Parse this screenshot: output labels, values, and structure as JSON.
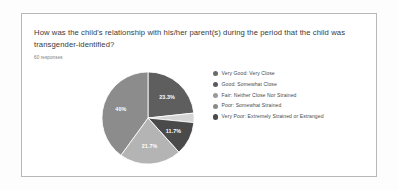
{
  "survey": {
    "question_line1": "How was the child's relationship with his/her parent(s) during the period that the child was",
    "question_line2": "transgender-identified?",
    "responses": "60 responses"
  },
  "chart_data": {
    "type": "pie",
    "title": "How was the child's relationship with his/her parent(s) during the period that the child was transgender-identified?",
    "subtitle": "60 responses",
    "total_responses": 60,
    "legend_position": "right",
    "categories": [
      "Very Good: Very Close",
      "Good: Somewhat Close",
      "Fair: Neither Close Nor Strained",
      "Poor: Somewhat Strained",
      "Very Poor: Extremely Strained or Estranged"
    ],
    "values": [
      23.3,
      3.3,
      11.7,
      21.7,
      40.0
    ],
    "value_labels": [
      "23.3%",
      "",
      "11.7%",
      "21.7%",
      "40%"
    ],
    "colors": [
      "#5e5e5e",
      "#d4d4d4",
      "#4a4a4a",
      "#b4b4b4",
      "#8c8c8c"
    ],
    "legend_colors": [
      "#6a6a6a",
      "#5a5a5a",
      "#9a9a9a",
      "#8a8a8a",
      "#4a4a4a"
    ],
    "slices": [
      {
        "label": "Very Good: Very Close",
        "percent": 23.3,
        "display": "23.3%",
        "color": "#5e5e5e",
        "show_label": true
      },
      {
        "label": "Good: Somewhat Close",
        "percent": 3.3,
        "display": "",
        "color": "#d4d4d4",
        "show_label": false
      },
      {
        "label": "Fair: Neither Close Nor Strained",
        "percent": 11.7,
        "display": "11.7%",
        "color": "#4a4a4a",
        "show_label": true
      },
      {
        "label": "Poor: Somewhat Strained",
        "percent": 21.7,
        "display": "21.7%",
        "color": "#b4b4b4",
        "show_label": true
      },
      {
        "label": "Very Poor: Extremely Strained or Estranged",
        "percent": 40.0,
        "display": "40%",
        "color": "#8c8c8c",
        "show_label": true
      }
    ]
  },
  "legend": {
    "items": [
      {
        "label": "Very Good: Very Close",
        "color": "#6a6a6a"
      },
      {
        "label": "Good: Somewhat Close",
        "color": "#5a5a5a"
      },
      {
        "label": "Fair: Neither Close Nor Strained",
        "color": "#9a9a9a"
      },
      {
        "label": "Poor: Somewhat Strained",
        "color": "#8a8a8a"
      },
      {
        "label": "Very Poor: Extremely Strained or Estranged",
        "color": "#4a4a4a"
      }
    ]
  }
}
